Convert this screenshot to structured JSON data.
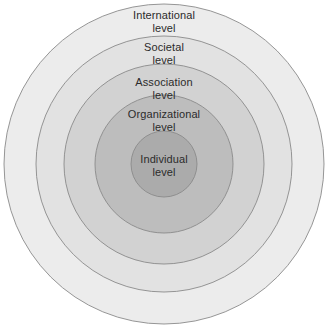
{
  "diagram": {
    "type": "concentric-circles",
    "center": {
      "x": 164,
      "y": 164
    },
    "background_color": "#ffffff",
    "stroke_color": "#8a8a8a",
    "text_color": "#2b2b2b",
    "rings": [
      {
        "id": "international",
        "label_line1": "International",
        "label_line2": "level",
        "radius": 160,
        "fill": "#ececec",
        "order": 1
      },
      {
        "id": "societal",
        "label_line1": "Societal",
        "label_line2": "level",
        "radius": 128,
        "fill": "#e2e2e2",
        "order": 2
      },
      {
        "id": "association",
        "label_line1": "Association",
        "label_line2": "level",
        "radius": 100,
        "fill": "#d2d2d2",
        "order": 3
      },
      {
        "id": "organizational",
        "label_line1": "Organizational",
        "label_line2": "level",
        "radius": 69,
        "fill": "#bdbdbd",
        "order": 4
      },
      {
        "id": "individual",
        "label_line1": "Individual",
        "label_line2": "level",
        "radius": 33,
        "fill": "#ababab",
        "order": 5
      }
    ]
  }
}
